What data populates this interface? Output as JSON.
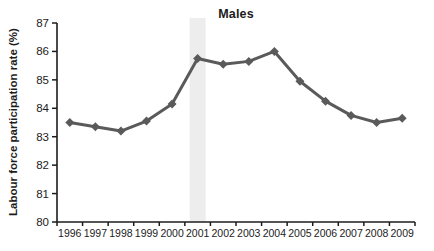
{
  "chart_data": {
    "type": "line",
    "title": "Males",
    "xlabel": "",
    "ylabel": "Labour force participation rate (%)",
    "x": [
      "1996",
      "1997",
      "1998",
      "1999",
      "2000",
      "2001",
      "2002",
      "2003",
      "2004",
      "2005",
      "2006",
      "2007",
      "2008",
      "2009"
    ],
    "series": [
      {
        "name": "Males",
        "color": "#5a5a5a",
        "marker": "diamond",
        "values": [
          83.5,
          83.35,
          83.2,
          83.55,
          84.15,
          85.75,
          85.55,
          85.65,
          86.0,
          84.95,
          84.25,
          83.75,
          83.5,
          83.65
        ]
      }
    ],
    "ylim": [
      80,
      87
    ],
    "yticks": [
      80,
      81,
      82,
      83,
      84,
      85,
      86,
      87
    ],
    "grid": false,
    "legend_position": "none",
    "highlight_band": {
      "category": "2001",
      "color": "#ededed"
    },
    "axis_color": "#1c1c1c",
    "tick_label_color": "#1c1c1c"
  }
}
